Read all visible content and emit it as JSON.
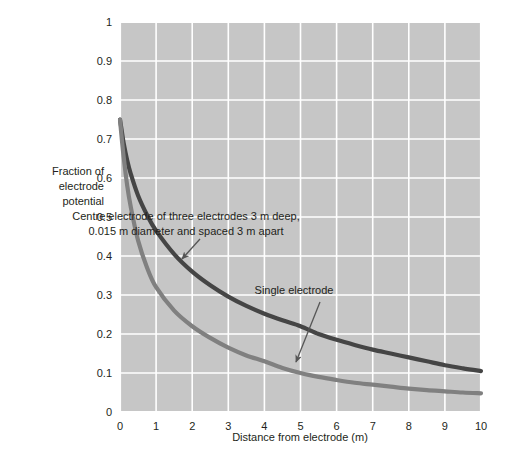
{
  "chart_data": {
    "type": "line",
    "title": "",
    "xlabel": "Distance from electrode (m)",
    "ylabel": "Fraction of electrode potential",
    "xlim": [
      0,
      10
    ],
    "ylim": [
      0,
      1
    ],
    "xticks": [
      "0",
      "1",
      "2",
      "3",
      "4",
      "5",
      "6",
      "7",
      "8",
      "9",
      "10"
    ],
    "yticks": [
      "0",
      "0.1",
      "0.2",
      "0.3",
      "0.4",
      "0.5",
      "0.6",
      "0.7",
      "0.8",
      "0.9",
      "1"
    ],
    "grid": true,
    "legend_position": "inline-annotations",
    "plot_background": "#c6c6c6",
    "gridline_color": "#ffffff",
    "series": [
      {
        "name": "Centre electrode of three electrodes 3 m deep, 0.015 m diameter and spaced 3 m apart",
        "color": "#454545",
        "x": [
          0,
          0.05,
          0.1,
          0.2,
          0.3,
          0.5,
          0.75,
          1,
          1.5,
          2,
          2.5,
          3,
          3.5,
          4,
          4.5,
          5,
          5.5,
          6,
          6.5,
          7,
          7.5,
          8,
          8.5,
          9,
          9.5,
          10
        ],
        "values": [
          0.75,
          0.72,
          0.69,
          0.645,
          0.61,
          0.555,
          0.505,
          0.465,
          0.405,
          0.36,
          0.325,
          0.296,
          0.272,
          0.252,
          0.235,
          0.22,
          0.2,
          0.185,
          0.172,
          0.16,
          0.15,
          0.14,
          0.13,
          0.12,
          0.112,
          0.105
        ]
      },
      {
        "name": "Single electrode",
        "color": "#808080",
        "x": [
          0,
          0.05,
          0.1,
          0.2,
          0.3,
          0.5,
          0.75,
          1,
          1.5,
          2,
          2.5,
          3,
          3.5,
          4,
          4.5,
          5,
          5.5,
          6,
          6.5,
          7,
          7.5,
          8,
          8.5,
          9,
          9.5,
          10
        ],
        "values": [
          0.75,
          0.7,
          0.655,
          0.58,
          0.525,
          0.44,
          0.37,
          0.32,
          0.26,
          0.22,
          0.19,
          0.165,
          0.145,
          0.13,
          0.113,
          0.1,
          0.09,
          0.082,
          0.075,
          0.07,
          0.065,
          0.06,
          0.056,
          0.053,
          0.05,
          0.048
        ]
      }
    ],
    "annotations": [
      {
        "name": "centre-electrode-annotation",
        "lines": [
          "Centre electrode of three electrodes 3 m deep,",
          "0.015 m diameter and spaced 3 m apart"
        ],
        "text_x": 186,
        "text_y": 220,
        "arrow_from": [
          200,
          239
        ],
        "arrow_to": [
          182,
          259
        ]
      },
      {
        "name": "single-electrode-annotation",
        "lines": [
          "Single electrode"
        ],
        "text_x": 294,
        "text_y": 294,
        "arrow_from": [
          320,
          302
        ],
        "arrow_to": [
          296,
          362
        ]
      }
    ]
  },
  "axes": {
    "y_label_lines": [
      "Fraction of",
      "electrode",
      "potential"
    ],
    "x_axis_title": "Distance from electrode (m)"
  }
}
